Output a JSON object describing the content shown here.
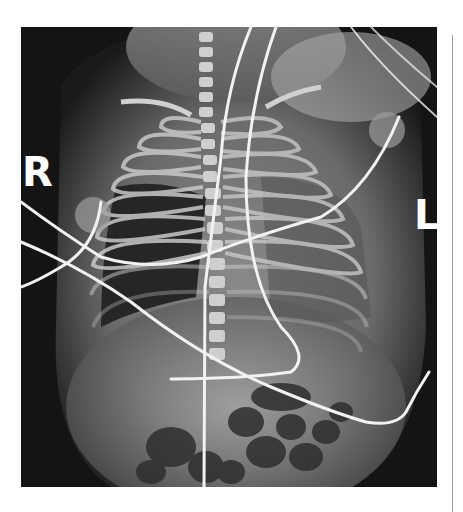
{
  "image": {
    "type": "radiograph",
    "description": "Frontal chest and abdomen X-ray of an infant with ECG leads and lines",
    "markers": {
      "right": "R",
      "left": "L"
    },
    "colors": {
      "background": "#ffffff",
      "film_dark": "#111111",
      "bone": "#d8d8d8",
      "lines": "#f2f2f2",
      "divider": "#9a9a9a"
    }
  }
}
